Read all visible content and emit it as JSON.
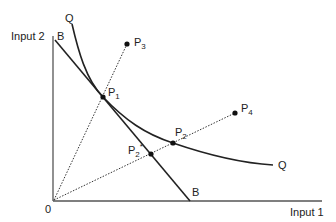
{
  "diagram": {
    "axes": {
      "y_label": "Input 2",
      "x_label": "Input 1",
      "origin_label": "0"
    },
    "curves": {
      "isoquant_label_top": "Q",
      "isoquant_label_end": "Q",
      "budget_label_top": "B",
      "budget_label_end": "B"
    },
    "points": [
      {
        "id": "P1",
        "label": "P",
        "sub": "1"
      },
      {
        "id": "P2",
        "label": "P",
        "sub": "2"
      },
      {
        "id": "P2star",
        "label": "P",
        "sub": "2",
        "sup": "*"
      },
      {
        "id": "P3",
        "label": "P",
        "sub": "3"
      },
      {
        "id": "P4",
        "label": "P",
        "sub": "4"
      }
    ]
  }
}
